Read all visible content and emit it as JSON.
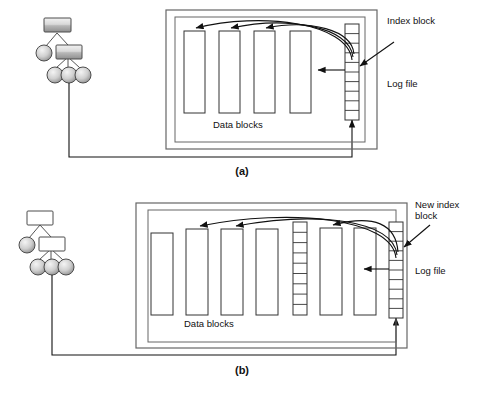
{
  "figure": {
    "panels": [
      {
        "id": "a",
        "caption": "(a)",
        "labels": {
          "index_block": "Index block",
          "log_file": "Log file",
          "data_blocks": "Data blocks"
        },
        "data_block_count": 4,
        "index_block_segments": 10,
        "tree": {
          "root_shape": "rectangle",
          "level2": [
            "circle",
            "rectangle"
          ],
          "level3": [
            "circle",
            "circle",
            "circle"
          ],
          "fill": "shaded-gray"
        },
        "arrows": {
          "curved_to_blocks": 3,
          "straight_to_block": 1,
          "into_index_from_right": 1,
          "feedback_from_tree": 1
        }
      },
      {
        "id": "b",
        "caption": "(b)",
        "labels": {
          "new_index_block": "New index block",
          "log_file": "Log file",
          "data_blocks": "Data blocks"
        },
        "data_block_count": 6,
        "old_index_block_segments": 9,
        "new_index_block_segments": 10,
        "tree": {
          "root_shape": "rectangle",
          "level2": [
            "circle",
            "rectangle"
          ],
          "level3": [
            "circle",
            "circle",
            "circle"
          ],
          "fill": "white-rect-gray-circle"
        },
        "arrows": {
          "curved_to_blocks": 3,
          "straight_to_block": 1,
          "into_index_from_right": 1,
          "feedback_from_tree": 1
        }
      }
    ],
    "colors": {
      "stroke": "#1a1a1a",
      "block_fill": "#ffffff",
      "node_gray_light": "#e8e8e8",
      "node_gray_dark": "#9a9a9a",
      "background": "#ffffff"
    }
  }
}
